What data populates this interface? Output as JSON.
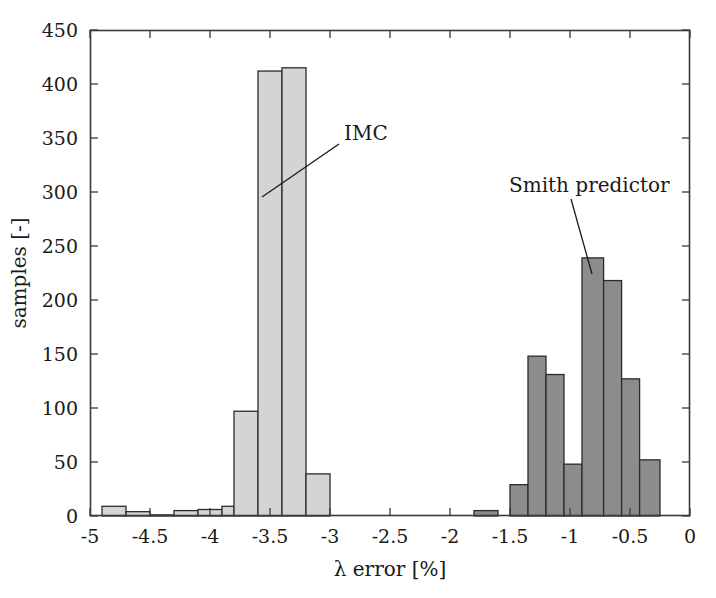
{
  "chart_data": {
    "type": "bar",
    "title": "",
    "subtitle": "",
    "xlabel": "λ error [%]",
    "ylabel": "samples [-]",
    "xlim": [
      -5,
      0
    ],
    "ylim": [
      0,
      450
    ],
    "xticks": [
      -5,
      -4.5,
      -4,
      -3.5,
      -3,
      -2.5,
      -2,
      -1.5,
      -1,
      -0.5,
      0
    ],
    "xtick_labels": [
      "-5",
      "-4.5",
      "-4",
      "-3.5",
      "-3",
      "-2.5",
      "-2",
      "-1.5",
      "-1",
      "-0.5",
      "0"
    ],
    "yticks": [
      0,
      50,
      100,
      150,
      200,
      250,
      300,
      350,
      400,
      450
    ],
    "ytick_labels": [
      "0",
      "50",
      "100",
      "150",
      "200",
      "250",
      "300",
      "350",
      "400",
      "450"
    ],
    "grid": false,
    "legend_position": "none",
    "bin_width": 0.2,
    "series": [
      {
        "name": "IMC",
        "fill_color": "#d4d4d4",
        "edge_color": "#2b2b2b",
        "bins": [
          {
            "x_left": -4.9,
            "x_right": -4.7,
            "value": 9
          },
          {
            "x_left": -4.7,
            "x_right": -4.5,
            "value": 4
          },
          {
            "x_left": -4.5,
            "x_right": -4.3,
            "value": 1
          },
          {
            "x_left": -4.3,
            "x_right": -4.1,
            "value": 5
          },
          {
            "x_left": -4.1,
            "x_right": -3.9,
            "value": 6
          },
          {
            "x_left": -3.9,
            "x_right": -3.8,
            "value": 9
          },
          {
            "x_left": -3.8,
            "x_right": -3.6,
            "value": 97
          },
          {
            "x_left": -3.6,
            "x_right": -3.4,
            "value": 412
          },
          {
            "x_left": -3.4,
            "x_right": -3.2,
            "value": 415
          },
          {
            "x_left": -3.2,
            "x_right": -3.0,
            "value": 39
          }
        ]
      },
      {
        "name": "Smith predictor",
        "fill_color": "#8c8c8c",
        "edge_color": "#2b2b2b",
        "bins": [
          {
            "x_left": -1.8,
            "x_right": -1.6,
            "value": 5
          },
          {
            "x_left": -1.5,
            "x_right": -1.35,
            "value": 29
          },
          {
            "x_left": -1.35,
            "x_right": -1.2,
            "value": 148
          },
          {
            "x_left": -1.2,
            "x_right": -1.05,
            "value": 131
          },
          {
            "x_left": -1.05,
            "x_right": -0.9,
            "value": 48
          },
          {
            "x_left": -0.9,
            "x_right": -0.72,
            "value": 239
          },
          {
            "x_left": -0.72,
            "x_right": -0.57,
            "value": 218
          },
          {
            "x_left": -0.57,
            "x_right": -0.42,
            "value": 127
          },
          {
            "x_left": -0.42,
            "x_right": -0.25,
            "value": 52
          }
        ]
      }
    ],
    "annotations": [
      {
        "text": "IMC",
        "label_x": 344,
        "label_y": 140,
        "leader_from_x": 339,
        "leader_from_y": 144,
        "leader_to_x": 262,
        "leader_to_y": 197
      },
      {
        "text": "Smith predictor",
        "label_x": 509,
        "label_y": 192,
        "leader_from_x": 571,
        "leader_from_y": 199,
        "leader_to_x": 592,
        "leader_to_y": 274
      }
    ]
  },
  "axes": {
    "plot_left_px": 90,
    "plot_right_px": 690,
    "plot_top_px": 30,
    "plot_bottom_px": 516,
    "frame_color": "#3a3a3a"
  }
}
